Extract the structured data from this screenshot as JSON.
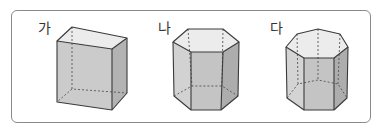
{
  "figures": [
    {
      "label": "가",
      "shape": "rectangular prism (사각기둥)"
    },
    {
      "label": "나",
      "shape": "hexagonal prism (육각기둥)"
    },
    {
      "label": "다",
      "shape": "octagonal prism (팔각기둥)"
    }
  ],
  "colors": {
    "border": "#8a8a8a",
    "face_top": "#ececec",
    "face_front": "#c9c9c9",
    "face_side": "#b5b5b5",
    "edge": "#3a3a3a"
  }
}
